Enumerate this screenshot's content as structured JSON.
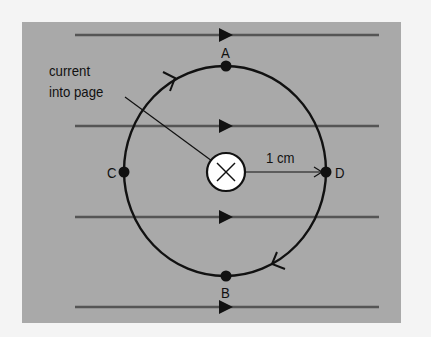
{
  "diagram": {
    "annotation": {
      "line1": "current",
      "line2": "into page"
    },
    "points": {
      "A": "A",
      "B": "B",
      "C": "C",
      "D": "D"
    },
    "radius_label": "1 cm",
    "center_symbol": "cross (current into page)",
    "field_lines": {
      "count": 4,
      "direction": "left-to-right"
    },
    "circle_path_direction": "clockwise",
    "colors": {
      "panel": "#a9a9a9",
      "background": "#f4f4f4",
      "field_line": "#555555",
      "circle": "#111111",
      "wire_fill": "#ffffff"
    }
  }
}
